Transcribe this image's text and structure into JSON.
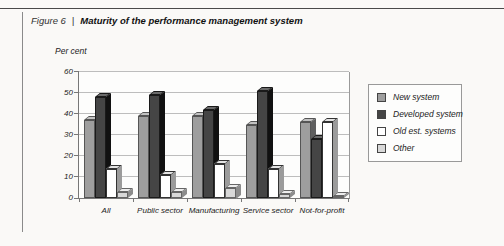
{
  "figure": {
    "label": "Figure 6",
    "separator": "|",
    "title": "Maturity of the performance management system"
  },
  "chart_data": {
    "type": "bar",
    "title": "Maturity of the performance management system",
    "ylabel": "Per cent",
    "xlabel": "",
    "ylim": [
      0,
      60
    ],
    "yticks": [
      0,
      10,
      20,
      30,
      40,
      50,
      60
    ],
    "grid": true,
    "legend_position": "right",
    "categories": [
      "All",
      "Public sector",
      "Manufacturing",
      "Service sector",
      "Not-for-profit"
    ],
    "series": [
      {
        "name": "New system",
        "values": [
          37,
          39,
          39,
          35,
          36
        ],
        "color": "#9e9e9e"
      },
      {
        "name": "Developed system",
        "values": [
          48,
          49,
          42,
          51,
          28
        ],
        "color": "#454545"
      },
      {
        "name": "Old est. systems",
        "values": [
          14,
          11,
          16,
          14,
          36
        ],
        "color": "#ffffff"
      },
      {
        "name": "Other",
        "values": [
          3,
          3,
          5,
          2,
          1
        ],
        "color": "#d8d8d8"
      }
    ]
  },
  "colors": {
    "grid": "#bdbdbd",
    "axis": "#777777",
    "series_side": [
      "#5f5f5f",
      "#111111",
      "#9b9b9b",
      "#8c8c8c"
    ],
    "series_top": [
      "#c2c2c2",
      "#6b6b6b",
      "#e4e4e4",
      "#eeeeee"
    ],
    "series_border": [
      "#555555",
      "#1a1a1a",
      "#333333",
      "#666666"
    ]
  }
}
